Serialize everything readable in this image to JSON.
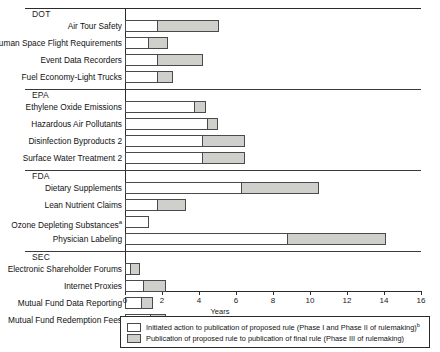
{
  "chart_data": {
    "type": "bar",
    "orientation": "horizontal",
    "subtype": "stacked-range",
    "title": "",
    "xlabel": "Years",
    "ylabel": "",
    "xlim": [
      0,
      16
    ],
    "xticks": [
      0,
      2,
      4,
      6,
      8,
      10,
      12,
      14,
      16
    ],
    "grid": false,
    "legend_position": "bottom",
    "series": [
      {
        "name": "Initiated action to publication of proposed rule (Phase I and Phase II of rulemaking)",
        "note_marker": "b",
        "color": "#ffffff",
        "values": [
          1.8,
          1.3,
          1.8,
          1.8,
          3.8,
          4.5,
          4.2,
          4.2,
          6.3,
          1.8,
          1.3,
          8.8,
          0.3,
          1.0,
          0.9,
          1.4
        ]
      },
      {
        "name": "Publication of proposed rule to publication of final rule (Phase III of rulemaking)",
        "color": "#cfcfcb",
        "values": [
          3.3,
          1.0,
          2.4,
          0.8,
          0.6,
          0.5,
          2.3,
          2.3,
          4.2,
          1.5,
          0.0,
          5.3,
          0.5,
          1.2,
          0.6,
          0.8
        ]
      }
    ],
    "categories": [
      "Air Tour Safety",
      "Human Space Flight Requirements",
      "Event Data Recorders",
      "Fuel Economy-Light Trucks",
      "Ethylene Oxide Emissions",
      "Hazardous Air Pollutants",
      "Disinfection Byproducts 2",
      "Surface Water Treatment 2",
      "Dietary Supplements",
      "Lean Nutrient Claims",
      "Ozone Depleting Substances",
      "Physician Labeling",
      "Electronic Shareholder Forums",
      "Internet Proxies",
      "Mutual Fund Data Reporting",
      "Mutual Fund Redemption Fees"
    ],
    "groups": [
      {
        "label": "DOT",
        "rules": [
          {
            "name": "Air Tour Safety",
            "phase12": 1.8,
            "phase3_end": 5.1,
            "note": ""
          },
          {
            "name": "Human Space Flight Requirements",
            "phase12": 1.3,
            "phase3_end": 2.3,
            "note": ""
          },
          {
            "name": "Event Data Recorders",
            "phase12": 1.8,
            "phase3_end": 4.2,
            "note": ""
          },
          {
            "name": "Fuel Economy-Light Trucks",
            "phase12": 1.8,
            "phase3_end": 2.6,
            "note": ""
          }
        ]
      },
      {
        "label": "EPA",
        "rules": [
          {
            "name": "Ethylene Oxide Emissions",
            "phase12": 3.8,
            "phase3_end": 4.4,
            "note": ""
          },
          {
            "name": "Hazardous Air Pollutants",
            "phase12": 4.5,
            "phase3_end": 5.0,
            "note": ""
          },
          {
            "name": "Disinfection Byproducts 2",
            "phase12": 4.2,
            "phase3_end": 6.5,
            "note": ""
          },
          {
            "name": "Surface Water Treatment 2",
            "phase12": 4.2,
            "phase3_end": 6.5,
            "note": ""
          }
        ]
      },
      {
        "label": "FDA",
        "rules": [
          {
            "name": "Dietary Supplements",
            "phase12": 6.3,
            "phase3_end": 10.5,
            "note": ""
          },
          {
            "name": "Lean Nutrient Claims",
            "phase12": 1.8,
            "phase3_end": 3.3,
            "note": ""
          },
          {
            "name": "Ozone Depleting Substances",
            "phase12": 1.3,
            "phase3_end": 1.3,
            "note": "a"
          },
          {
            "name": "Physician Labeling",
            "phase12": 8.8,
            "phase3_end": 14.1,
            "note": ""
          }
        ]
      },
      {
        "label": "SEC",
        "rules": [
          {
            "name": "Electronic Shareholder Forums",
            "phase12": 0.3,
            "phase3_end": 0.8,
            "note": ""
          },
          {
            "name": "Internet Proxies",
            "phase12": 1.0,
            "phase3_end": 2.2,
            "note": ""
          },
          {
            "name": "Mutual Fund Data Reporting",
            "phase12": 0.9,
            "phase3_end": 1.5,
            "note": ""
          },
          {
            "name": "Mutual Fund Redemption Fees",
            "phase12": 1.4,
            "phase3_end": 2.2,
            "note": ""
          }
        ]
      }
    ],
    "legend": [
      {
        "swatch": "white",
        "text": "Initiated action to publication of proposed rule (Phase I and Phase II of rulemaking)",
        "note": "b"
      },
      {
        "swatch": "gray",
        "text": "Publication of proposed rule to publication of final rule (Phase III of rulemaking)",
        "note": ""
      }
    ]
  },
  "colors": {
    "phase12": "#ffffff",
    "phase3": "#cfcfcb",
    "stroke": "#4a4a4a",
    "axis": "#2b2b2b"
  }
}
